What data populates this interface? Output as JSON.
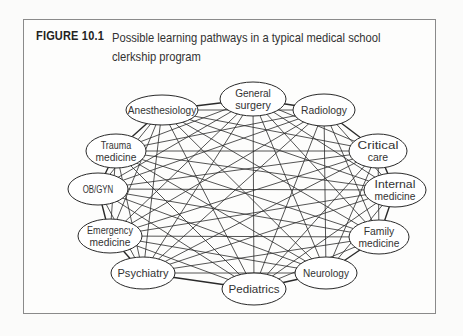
{
  "figure": {
    "label": "FIGURE 10.1",
    "caption_line1": "Possible learning pathways in a typical medical school",
    "caption_line2": "clerkship program"
  },
  "diagram": {
    "type": "complete-graph",
    "nodes": [
      {
        "id": "general-surgery",
        "lines": [
          "General",
          "surgery"
        ],
        "cx": 253,
        "cy": 99,
        "rx": 33,
        "ry": 17
      },
      {
        "id": "radiology",
        "lines": [
          "Radiology"
        ],
        "cx": 324,
        "cy": 110,
        "rx": 31,
        "ry": 16
      },
      {
        "id": "critical-care",
        "lines": [
          "Critical",
          "care"
        ],
        "cx": 378,
        "cy": 151,
        "rx": 29,
        "ry": 17
      },
      {
        "id": "internal-medicine",
        "lines": [
          "Internal",
          "medicine"
        ],
        "cx": 395,
        "cy": 190,
        "rx": 31,
        "ry": 17
      },
      {
        "id": "family-medicine",
        "lines": [
          "Family",
          "medicine"
        ],
        "cx": 379,
        "cy": 237,
        "rx": 30,
        "ry": 17
      },
      {
        "id": "neurology",
        "lines": [
          "Neurology"
        ],
        "cx": 326,
        "cy": 273,
        "rx": 31,
        "ry": 16
      },
      {
        "id": "pediatrics",
        "lines": [
          "Pediatrics"
        ],
        "cx": 254,
        "cy": 289,
        "rx": 32,
        "ry": 16
      },
      {
        "id": "psychiatry",
        "lines": [
          "Psychiatry"
        ],
        "cx": 143,
        "cy": 273,
        "rx": 32,
        "ry": 16
      },
      {
        "id": "emergency-medicine",
        "lines": [
          "Emergency",
          "medicine"
        ],
        "cx": 110,
        "cy": 236,
        "rx": 32,
        "ry": 17
      },
      {
        "id": "obgyn",
        "lines": [
          "OB/GYN"
        ],
        "cx": 98,
        "cy": 189,
        "rx": 30,
        "ry": 16
      },
      {
        "id": "trauma-medicine",
        "lines": [
          "Trauma",
          "medicine"
        ],
        "cx": 116,
        "cy": 151,
        "rx": 30,
        "ry": 17
      },
      {
        "id": "anesthesiology",
        "lines": [
          "Anesthesiology"
        ],
        "cx": 162,
        "cy": 110,
        "rx": 36,
        "ry": 15
      }
    ],
    "edges": "all-pairs",
    "colors": {
      "stroke": "#2a2a2a",
      "fill": "#ffffff",
      "frame": "#8a8a8a"
    }
  }
}
